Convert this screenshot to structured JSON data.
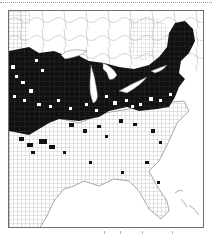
{
  "map": {
    "type": "choropleth",
    "region": "Eastern United States (county level)",
    "fill_colors": {
      "present": "#111111",
      "absent": "#ffffff",
      "county_lines": "#8a8a8a",
      "water": "#ffffff"
    },
    "legend": null
  },
  "layout": {
    "top_rule": "dotted",
    "frame": "border"
  }
}
